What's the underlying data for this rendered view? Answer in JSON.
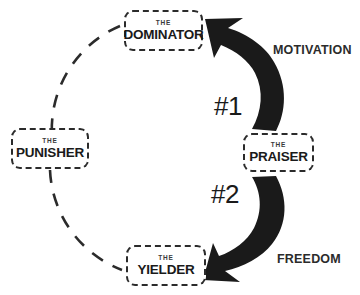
{
  "diagram": {
    "colors": {
      "ink": "#1a1a1a",
      "dash_stroke": "#2b2b2b",
      "arrow_fill": "#1a1a1a",
      "background": "#ffffff"
    },
    "nodes": [
      {
        "id": "dominator",
        "article": "THE",
        "name": "DOMINATOR",
        "position": "top"
      },
      {
        "id": "punisher",
        "article": "THE",
        "name": "PUNISHER",
        "position": "left"
      },
      {
        "id": "praiser",
        "article": "THE",
        "name": "PRAISER",
        "position": "right"
      },
      {
        "id": "yielder",
        "article": "THE",
        "name": "YIELDER",
        "position": "bottom"
      }
    ],
    "steps": [
      {
        "id": "step1",
        "label": "#1",
        "outcome": "MOTIVATION",
        "from": "praiser",
        "to": "dominator"
      },
      {
        "id": "step2",
        "label": "#2",
        "outcome": "FREEDOM",
        "from": "praiser",
        "to": "yielder"
      }
    ],
    "arc": {
      "style": "dashed",
      "description": "dashed circular arc linking dominator, punisher and yielder"
    }
  }
}
